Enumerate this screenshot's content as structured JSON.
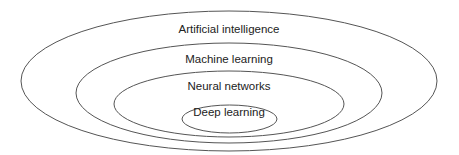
{
  "diagram": {
    "type": "nested-ellipses",
    "stroke_color": "#555555",
    "text_color": "#222222",
    "layers": [
      {
        "label": "Artificial intelligence",
        "cx": 229,
        "cy": 81,
        "rx": 208,
        "ry": 70,
        "label_x": 229,
        "label_y": 29
      },
      {
        "label": "Machine learning",
        "cx": 229,
        "cy": 93,
        "rx": 153,
        "ry": 50,
        "label_x": 229,
        "label_y": 59
      },
      {
        "label": "Neural networks",
        "cx": 229,
        "cy": 104,
        "rx": 115,
        "ry": 33,
        "label_x": 229,
        "label_y": 86
      },
      {
        "label": "Deep learning",
        "cx": 229.5,
        "cy": 119,
        "rx": 47.5,
        "ry": 14,
        "label_x": 229,
        "label_y": 112
      }
    ]
  }
}
